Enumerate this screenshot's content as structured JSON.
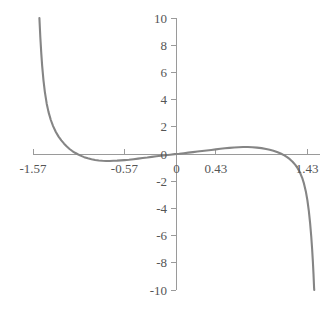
{
  "chart_data": {
    "type": "line",
    "title": "",
    "subtitle": "",
    "xlabel": "",
    "ylabel": "",
    "xlim": [
      -1.57,
      1.57
    ],
    "ylim": [
      -10,
      10
    ],
    "grid": false,
    "legend": null,
    "annotations": [],
    "x_ticks": [
      {
        "value": -1.57,
        "label": "-1.57"
      },
      {
        "value": -0.57,
        "label": "-0.57"
      },
      {
        "value": 0,
        "label": "0"
      },
      {
        "value": 0.43,
        "label": "0.43"
      },
      {
        "value": 1.43,
        "label": "1.43"
      }
    ],
    "y_ticks": [
      {
        "value": 10,
        "label": "10"
      },
      {
        "value": 8,
        "label": "8"
      },
      {
        "value": 6,
        "label": "6"
      },
      {
        "value": 4,
        "label": "4"
      },
      {
        "value": 2,
        "label": "2"
      },
      {
        "value": 0,
        "label": "0"
      },
      {
        "value": -2,
        "label": "-2"
      },
      {
        "value": -4,
        "label": "-4"
      },
      {
        "value": -6,
        "label": "-6"
      },
      {
        "value": -8,
        "label": "-8"
      },
      {
        "value": -10,
        "label": "-10"
      }
    ],
    "series": [
      {
        "name": "curve",
        "color": "#858585",
        "points": [
          [
            -1.5,
            10.0
          ],
          [
            -1.49,
            8.6
          ],
          [
            -1.48,
            7.45
          ],
          [
            -1.47,
            6.5
          ],
          [
            -1.455,
            5.4
          ],
          [
            -1.44,
            4.55
          ],
          [
            -1.42,
            3.7
          ],
          [
            -1.4,
            3.08
          ],
          [
            -1.375,
            2.5
          ],
          [
            -1.35,
            2.05
          ],
          [
            -1.32,
            1.62
          ],
          [
            -1.29,
            1.28
          ],
          [
            -1.26,
            1.0
          ],
          [
            -1.23,
            0.76
          ],
          [
            -1.2,
            0.55
          ],
          [
            -1.17,
            0.37
          ],
          [
            -1.14,
            0.22
          ],
          [
            -1.11,
            0.09
          ],
          [
            -1.08,
            -0.02
          ],
          [
            -1.05,
            -0.12
          ],
          [
            -1.01,
            -0.23
          ],
          [
            -0.97,
            -0.32
          ],
          [
            -0.93,
            -0.39
          ],
          [
            -0.89,
            -0.44
          ],
          [
            -0.85,
            -0.48
          ],
          [
            -0.81,
            -0.5
          ],
          [
            -0.77,
            -0.51
          ],
          [
            -0.73,
            -0.51
          ],
          [
            -0.69,
            -0.5
          ],
          [
            -0.65,
            -0.49
          ],
          [
            -0.61,
            -0.47
          ],
          [
            -0.57,
            -0.45
          ],
          [
            -0.52,
            -0.42
          ],
          [
            -0.47,
            -0.38
          ],
          [
            -0.42,
            -0.34
          ],
          [
            -0.37,
            -0.3
          ],
          [
            -0.32,
            -0.26
          ],
          [
            -0.27,
            -0.21
          ],
          [
            -0.22,
            -0.17
          ],
          [
            -0.17,
            -0.13
          ],
          [
            -0.12,
            -0.09
          ],
          [
            -0.07,
            -0.05
          ],
          [
            -0.02,
            -0.01
          ],
          [
            0.03,
            0.02
          ],
          [
            0.08,
            0.06
          ],
          [
            0.13,
            0.1
          ],
          [
            0.18,
            0.14
          ],
          [
            0.23,
            0.18
          ],
          [
            0.28,
            0.22
          ],
          [
            0.33,
            0.26
          ],
          [
            0.38,
            0.3
          ],
          [
            0.43,
            0.34
          ],
          [
            0.48,
            0.38
          ],
          [
            0.53,
            0.42
          ],
          [
            0.58,
            0.45
          ],
          [
            0.63,
            0.48
          ],
          [
            0.68,
            0.5
          ],
          [
            0.73,
            0.51
          ],
          [
            0.78,
            0.51
          ],
          [
            0.83,
            0.5
          ],
          [
            0.88,
            0.47
          ],
          [
            0.93,
            0.43
          ],
          [
            0.98,
            0.37
          ],
          [
            1.02,
            0.31
          ],
          [
            1.06,
            0.24
          ],
          [
            1.1,
            0.15
          ],
          [
            1.14,
            0.04
          ],
          [
            1.18,
            -0.1
          ],
          [
            1.21,
            -0.23
          ],
          [
            1.24,
            -0.38
          ],
          [
            1.27,
            -0.57
          ],
          [
            1.3,
            -0.8
          ],
          [
            1.325,
            -1.04
          ],
          [
            1.35,
            -1.35
          ],
          [
            1.375,
            -1.75
          ],
          [
            1.395,
            -2.18
          ],
          [
            1.415,
            -2.75
          ],
          [
            1.432,
            -3.4
          ],
          [
            1.448,
            -4.2
          ],
          [
            1.462,
            -5.1
          ],
          [
            1.474,
            -6.05
          ],
          [
            1.484,
            -7.0
          ],
          [
            1.492,
            -7.9
          ],
          [
            1.499,
            -8.85
          ],
          [
            1.505,
            -9.8
          ],
          [
            1.507,
            -10.0
          ]
        ]
      }
    ]
  },
  "plot_geometry": {
    "x_axis_pixel_y": 154,
    "y_axis_pixel_x": 176,
    "x_axis_pixel_start": 33,
    "x_axis_pixel_end": 320,
    "y_axis_pixel_top": 18,
    "y_axis_pixel_bottom": 290
  },
  "colors": {
    "background": "#ffffff",
    "axis": "#9a9a9a",
    "curve": "#858585",
    "label_text": "#555555"
  }
}
